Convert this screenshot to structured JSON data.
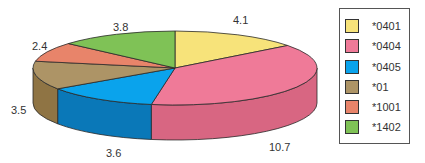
{
  "chart_data": {
    "type": "pie",
    "style": "3d",
    "title": "",
    "categories": [
      "*0401",
      "*0404",
      "*0405",
      "*01",
      "*1001",
      "*1402"
    ],
    "values": [
      4.1,
      10.7,
      3.6,
      3.5,
      2.4,
      3.8
    ],
    "colors": [
      "#f7e37a",
      "#ef7a98",
      "#0aa3ec",
      "#ad9466",
      "#e8846a",
      "#7fc256"
    ],
    "side_colors": [
      "#d9c560",
      "#d86682",
      "#0a78b8",
      "#8f7444",
      "#c66a52",
      "#63a03e"
    ],
    "data_labels": [
      "4.1",
      "10.7",
      "3.6",
      "3.5",
      "2.4",
      "3.8"
    ],
    "legend_position": "right",
    "start_angle": "12 o'clock, clockwise"
  },
  "legend": {
    "items": [
      {
        "label": "*0401",
        "color": "#f7e37a"
      },
      {
        "label": "*0404",
        "color": "#ef7a98"
      },
      {
        "label": "*0405",
        "color": "#0aa3ec"
      },
      {
        "label": "*01",
        "color": "#ad9466"
      },
      {
        "label": "*1001",
        "color": "#e8846a"
      },
      {
        "label": "*1402",
        "color": "#7fc256"
      }
    ]
  },
  "labels": {
    "l0": "4.1",
    "l1": "10.7",
    "l2": "3.6",
    "l3": "3.5",
    "l4": "2.4",
    "l5": "3.8"
  }
}
